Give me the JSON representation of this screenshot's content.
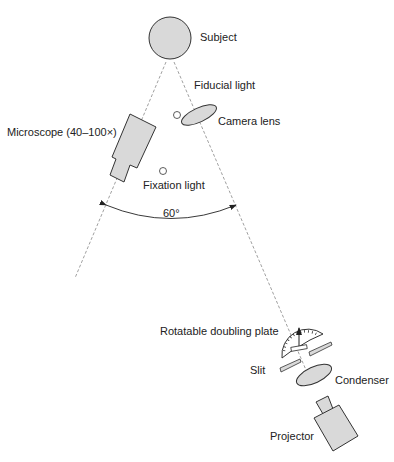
{
  "diagram": {
    "type": "optical-setup",
    "angle_label": "60°",
    "colors": {
      "fill": "#d9d9d9",
      "stroke": "#333333",
      "dashed_line": "#888888"
    },
    "components": {
      "subject": "Subject",
      "fiducial_light": "Fiducial light",
      "camera_lens": "Camera lens",
      "microscope": "Microscope (40–100×)",
      "fixation_light": "Fixation light",
      "doubling_plate": "Rotatable doubling plate",
      "slit": "Slit",
      "condenser": "Condenser",
      "projector": "Projector"
    }
  }
}
